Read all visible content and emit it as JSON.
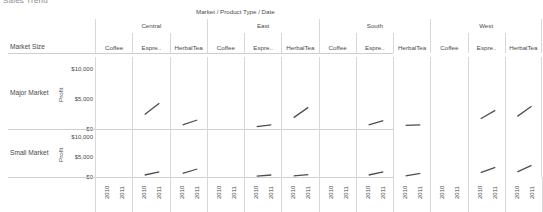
{
  "clipped_title": "Sales Trend",
  "field_header": "Market  /  Product Type  /  Date",
  "corner_label": "Market Size",
  "axis_title": "Profit",
  "y_ticks": [
    "$10,000",
    "$5,000",
    "$0"
  ],
  "x_ticks": [
    "2010",
    "2011"
  ],
  "regions": [
    "Central",
    "East",
    "South",
    "West"
  ],
  "products": [
    "Coffee",
    "Espre..",
    "Herbal Tea"
  ],
  "market_sizes": [
    "Major Market",
    "Small Market"
  ],
  "chart_data": {
    "type": "line",
    "title": "Sales Trend",
    "xlabel": "Date",
    "ylabel": "Profit",
    "ylim": [
      0,
      12000
    ],
    "y_tick_values": [
      10000,
      5000,
      0
    ],
    "x": [
      "2010",
      "2011"
    ],
    "grid": true,
    "legend": "none",
    "row_field": "Market Size",
    "column_fields": [
      "Market",
      "Product Type",
      "Date"
    ],
    "panels": [
      {
        "market_size": "Major Market",
        "region": "Central",
        "product": "Coffee",
        "values": [
          null,
          null
        ]
      },
      {
        "market_size": "Major Market",
        "region": "Central",
        "product": "Espre..",
        "values": [
          2400,
          4300
        ]
      },
      {
        "market_size": "Major Market",
        "region": "Central",
        "product": "Herbal Tea",
        "values": [
          700,
          1500
        ]
      },
      {
        "market_size": "Major Market",
        "region": "East",
        "product": "Coffee",
        "values": [
          null,
          null
        ]
      },
      {
        "market_size": "Major Market",
        "region": "East",
        "product": "Espre..",
        "values": [
          400,
          700
        ]
      },
      {
        "market_size": "Major Market",
        "region": "East",
        "product": "Herbal Tea",
        "values": [
          1900,
          3600
        ]
      },
      {
        "market_size": "Major Market",
        "region": "South",
        "product": "Coffee",
        "values": [
          null,
          null
        ]
      },
      {
        "market_size": "Major Market",
        "region": "South",
        "product": "Espre..",
        "values": [
          700,
          1400
        ]
      },
      {
        "market_size": "Major Market",
        "region": "South",
        "product": "Herbal Tea",
        "values": [
          600,
          700
        ]
      },
      {
        "market_size": "Major Market",
        "region": "West",
        "product": "Coffee",
        "values": [
          null,
          null
        ]
      },
      {
        "market_size": "Major Market",
        "region": "West",
        "product": "Espre..",
        "values": [
          1700,
          3100
        ]
      },
      {
        "market_size": "Major Market",
        "region": "West",
        "product": "Herbal Tea",
        "values": [
          2100,
          3800
        ]
      },
      {
        "market_size": "Small Market",
        "region": "Central",
        "product": "Coffee",
        "values": [
          null,
          null
        ]
      },
      {
        "market_size": "Small Market",
        "region": "Central",
        "product": "Espre..",
        "values": [
          500,
          1300
        ]
      },
      {
        "market_size": "Small Market",
        "region": "Central",
        "product": "Herbal Tea",
        "values": [
          900,
          2000
        ]
      },
      {
        "market_size": "Small Market",
        "region": "East",
        "product": "Coffee",
        "values": [
          null,
          null
        ]
      },
      {
        "market_size": "Small Market",
        "region": "East",
        "product": "Espre..",
        "values": [
          200,
          500
        ]
      },
      {
        "market_size": "Small Market",
        "region": "East",
        "product": "Herbal Tea",
        "values": [
          300,
          600
        ]
      },
      {
        "market_size": "Small Market",
        "region": "South",
        "product": "Coffee",
        "values": [
          null,
          null
        ]
      },
      {
        "market_size": "Small Market",
        "region": "South",
        "product": "Espre..",
        "values": [
          500,
          1300
        ]
      },
      {
        "market_size": "Small Market",
        "region": "South",
        "product": "Herbal Tea",
        "values": [
          300,
          900
        ]
      },
      {
        "market_size": "Small Market",
        "region": "West",
        "product": "Coffee",
        "values": [
          null,
          null
        ]
      },
      {
        "market_size": "Small Market",
        "region": "West",
        "product": "Espre..",
        "values": [
          1100,
          2400
        ]
      },
      {
        "market_size": "Small Market",
        "region": "West",
        "product": "Herbal Tea",
        "values": [
          1300,
          2900
        ]
      }
    ]
  }
}
